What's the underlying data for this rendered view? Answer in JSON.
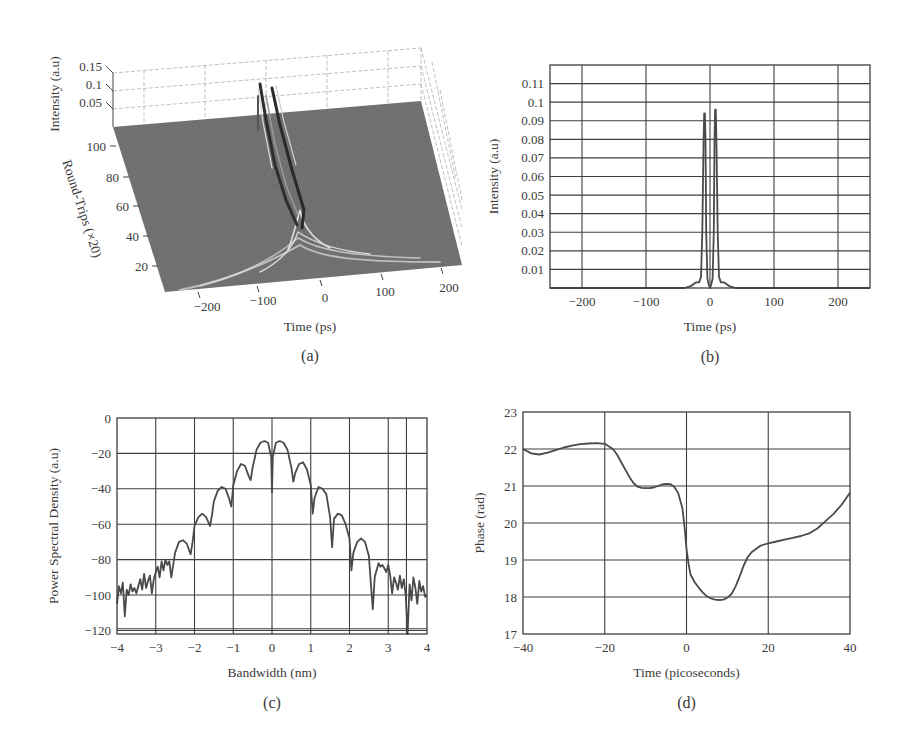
{
  "chart_data": [
    {
      "id": "a",
      "type": "surface3d",
      "caption": "(a)",
      "title": "",
      "xlabel": "Time (ps)",
      "ylabel": "Round-Trips (×20)",
      "zlabel": "Intensity (a.u)",
      "x_ticks": [
        "−200",
        "−100",
        "0",
        "100",
        "200"
      ],
      "y_ticks": [
        "20",
        "40",
        "60",
        "80",
        "100"
      ],
      "z_ticks": [
        "0.05",
        "0.1",
        "0.15"
      ],
      "xlim": [
        -250,
        250
      ],
      "ylim": [
        0,
        110
      ],
      "zlim": [
        0,
        0.15
      ],
      "description": "Pulse evolution: broad noisy pulse at early round-trips narrows and splits into two parallel peaks near t≈0 reaching ~0.1 by round-trip 100",
      "peak_tracks": [
        {
          "name": "left peak",
          "t": -8,
          "z_final": 0.094
        },
        {
          "name": "right peak",
          "t": 8,
          "z_final": 0.096
        }
      ]
    },
    {
      "id": "b",
      "type": "line",
      "caption": "(b)",
      "title": "",
      "xlabel": "Time (ps)",
      "ylabel": "Intensity (a.u)",
      "xlim": [
        -250,
        250
      ],
      "ylim": [
        0,
        0.12
      ],
      "grid": true,
      "x_ticks": [
        "−200",
        "−100",
        "0",
        "100",
        "200"
      ],
      "x_tick_values": [
        -200,
        -100,
        0,
        100,
        200
      ],
      "y_ticks": [
        "0.01",
        "0.02",
        "0.03",
        "0.04",
        "0.05",
        "0.06",
        "0.07",
        "0.08",
        "0.09",
        "0.1",
        "0.11"
      ],
      "y_tick_values": [
        0.01,
        0.02,
        0.03,
        0.04,
        0.05,
        0.06,
        0.07,
        0.08,
        0.09,
        0.1,
        0.11
      ],
      "x": [
        -250,
        -40,
        -30,
        -22,
        -17,
        -14,
        -12,
        -10,
        -9,
        -8,
        -7,
        -6,
        -4,
        -2,
        0,
        2,
        4,
        6,
        7,
        8,
        9,
        10,
        12,
        14,
        17,
        22,
        30,
        40,
        250
      ],
      "values": [
        0,
        0,
        0.001,
        0.003,
        0.003,
        0.006,
        0.03,
        0.08,
        0.094,
        0.094,
        0.08,
        0.03,
        0.005,
        0.002,
        0,
        0.002,
        0.005,
        0.03,
        0.08,
        0.096,
        0.096,
        0.08,
        0.03,
        0.006,
        0.003,
        0.003,
        0.001,
        0,
        0
      ]
    },
    {
      "id": "c",
      "type": "line",
      "caption": "(c)",
      "title": "",
      "xlabel": "Bandwidth (nm)",
      "ylabel": "Power Spectral Density (a.u)",
      "xlim": [
        -4,
        4
      ],
      "ylim": [
        -122,
        0
      ],
      "grid": true,
      "x_ticks": [
        "−4",
        "−3",
        "−2",
        "−1",
        "0",
        "1",
        "2",
        "3",
        "4"
      ],
      "x_tick_values": [
        -4,
        -3,
        -2,
        -1,
        0,
        1,
        2,
        3,
        4
      ],
      "y_ticks": [
        "0",
        "−20",
        "−40",
        "−60",
        "−80",
        "−100",
        "−120"
      ],
      "y_tick_values": [
        0,
        -20,
        -40,
        -60,
        -80,
        -100,
        -120
      ],
      "x": [
        -4,
        -3.95,
        -3.9,
        -3.85,
        -3.8,
        -3.75,
        -3.7,
        -3.65,
        -3.6,
        -3.55,
        -3.5,
        -3.45,
        -3.4,
        -3.35,
        -3.3,
        -3.25,
        -3.2,
        -3.15,
        -3.1,
        -3.05,
        -3.0,
        -2.95,
        -2.9,
        -2.85,
        -2.8,
        -2.75,
        -2.7,
        -2.65,
        -2.6,
        -2.5,
        -2.4,
        -2.3,
        -2.2,
        -2.1,
        -2.05,
        -2.0,
        -1.9,
        -1.8,
        -1.7,
        -1.6,
        -1.55,
        -1.5,
        -1.4,
        -1.3,
        -1.2,
        -1.1,
        -1.05,
        -1.0,
        -0.9,
        -0.8,
        -0.7,
        -0.6,
        -0.55,
        -0.5,
        -0.4,
        -0.3,
        -0.2,
        -0.1,
        -0.02,
        0.0,
        0.02,
        0.1,
        0.2,
        0.3,
        0.4,
        0.5,
        0.55,
        0.6,
        0.7,
        0.8,
        0.9,
        1.0,
        1.05,
        1.1,
        1.2,
        1.3,
        1.4,
        1.5,
        1.55,
        1.6,
        1.7,
        1.8,
        1.9,
        2.0,
        2.05,
        2.1,
        2.2,
        2.3,
        2.4,
        2.5,
        2.55,
        2.6,
        2.65,
        2.7,
        2.75,
        2.8,
        2.85,
        2.9,
        2.95,
        3.0,
        3.05,
        3.1,
        3.15,
        3.2,
        3.25,
        3.3,
        3.35,
        3.4,
        3.45,
        3.5,
        3.55,
        3.6,
        3.65,
        3.7,
        3.75,
        3.8,
        3.85,
        3.9,
        3.95,
        4.0
      ],
      "values": [
        -105,
        -95,
        -99,
        -93,
        -112,
        -97,
        -100,
        -94,
        -98,
        -96,
        -99,
        -95,
        -91,
        -97,
        -88,
        -96,
        -92,
        -89,
        -99,
        -91,
        -87,
        -84,
        -90,
        -81,
        -86,
        -80,
        -83,
        -81,
        -90,
        -76,
        -70,
        -69,
        -71,
        -77,
        -70,
        -61,
        -56,
        -54,
        -56,
        -61,
        -55,
        -47,
        -41,
        -39,
        -40,
        -46,
        -50,
        -38,
        -30,
        -26,
        -27,
        -33,
        -35,
        -28,
        -18,
        -14,
        -13,
        -14,
        -22,
        -42,
        -22,
        -14,
        -13,
        -14,
        -18,
        -28,
        -36,
        -31,
        -26,
        -25,
        -29,
        -38,
        -54,
        -45,
        -39,
        -40,
        -43,
        -56,
        -73,
        -57,
        -54,
        -55,
        -60,
        -68,
        -86,
        -76,
        -70,
        -68,
        -70,
        -78,
        -93,
        -108,
        -90,
        -86,
        -82,
        -84,
        -83,
        -85,
        -87,
        -83,
        -89,
        -99,
        -90,
        -93,
        -97,
        -89,
        -96,
        -91,
        -100,
        -122,
        -94,
        -103,
        -90,
        -96,
        -105,
        -92,
        -98,
        -95,
        -101,
        -100
      ]
    },
    {
      "id": "d",
      "type": "line",
      "caption": "(d)",
      "title": "",
      "xlabel": "Time (picoseconds)",
      "ylabel": "Phase (rad)",
      "xlim": [
        -40,
        40
      ],
      "ylim": [
        17,
        23
      ],
      "grid": true,
      "x_ticks": [
        "−40",
        "−20",
        "0",
        "20",
        "40"
      ],
      "x_tick_values": [
        -40,
        -20,
        0,
        20,
        40
      ],
      "y_ticks": [
        "17",
        "18",
        "19",
        "20",
        "21",
        "22",
        "23"
      ],
      "y_tick_values": [
        17,
        18,
        19,
        20,
        21,
        22,
        23
      ],
      "x": [
        -40,
        -38,
        -36,
        -34,
        -32,
        -30,
        -28,
        -26,
        -24,
        -22,
        -20,
        -18,
        -17,
        -16,
        -15,
        -14,
        -13,
        -12,
        -11,
        -10,
        -9,
        -8,
        -7,
        -6,
        -5,
        -4,
        -3,
        -2,
        -1,
        -0.5,
        0,
        0.5,
        1,
        2,
        3,
        4,
        5,
        6,
        7,
        8,
        9,
        10,
        11,
        12,
        13,
        14,
        15,
        16,
        17,
        18,
        19,
        20,
        22,
        24,
        26,
        28,
        30,
        32,
        34,
        36,
        38,
        40
      ],
      "values": [
        22.0,
        21.88,
        21.85,
        21.9,
        21.97,
        22.04,
        22.09,
        22.13,
        22.15,
        22.16,
        22.14,
        22.0,
        21.85,
        21.65,
        21.45,
        21.25,
        21.08,
        20.98,
        20.95,
        20.94,
        20.94,
        20.96,
        21.0,
        21.04,
        21.06,
        21.05,
        20.98,
        20.8,
        20.4,
        19.9,
        19.3,
        18.9,
        18.6,
        18.4,
        18.25,
        18.12,
        18.02,
        17.96,
        17.93,
        17.92,
        17.93,
        17.98,
        18.08,
        18.28,
        18.55,
        18.85,
        19.08,
        19.22,
        19.3,
        19.38,
        19.42,
        19.45,
        19.5,
        19.55,
        19.6,
        19.65,
        19.72,
        19.85,
        20.05,
        20.25,
        20.5,
        20.82
      ]
    }
  ]
}
